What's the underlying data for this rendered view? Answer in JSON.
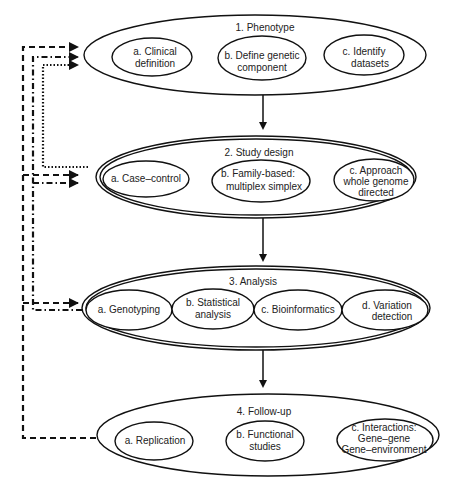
{
  "diagram": {
    "stages": [
      {
        "title": "1. Phenotype",
        "items": [
          {
            "lines": [
              "a. Clinical",
              "definition"
            ]
          },
          {
            "lines": [
              "b. Define genetic",
              "component"
            ]
          },
          {
            "lines": [
              "c. Identify",
              "datasets"
            ]
          }
        ]
      },
      {
        "title": "2. Study design",
        "items": [
          {
            "lines": [
              "a. Case–control"
            ]
          },
          {
            "lines": [
              "b. Family-based:",
              "multiplex simplex"
            ]
          },
          {
            "lines": [
              "c. Approach",
              "whole genome",
              "directed"
            ]
          }
        ]
      },
      {
        "title": "3. Analysis",
        "items": [
          {
            "lines": [
              "a. Genotyping"
            ]
          },
          {
            "lines": [
              "b. Statistical",
              "analysis"
            ]
          },
          {
            "lines": [
              "c. Bioinformatics"
            ]
          },
          {
            "lines": [
              "d. Variation",
              "detection"
            ]
          }
        ]
      },
      {
        "title": "4. Follow-up",
        "items": [
          {
            "lines": [
              "a. Replication"
            ]
          },
          {
            "lines": [
              "b. Functional",
              "studies"
            ]
          },
          {
            "lines": [
              "c. Interactions:",
              "Gene–gene",
              "Gene–environment"
            ]
          }
        ]
      }
    ],
    "feedback_lines": [
      {
        "style": "dotted",
        "from": "2. Study design",
        "to": "1. Phenotype"
      },
      {
        "style": "dash-dot",
        "from": "3. Analysis",
        "to": "1. Phenotype / 2. Study design"
      },
      {
        "style": "dashed",
        "from": "4. Follow-up",
        "to": "1. Phenotype / 2. Study design / 3. Analysis"
      }
    ]
  }
}
